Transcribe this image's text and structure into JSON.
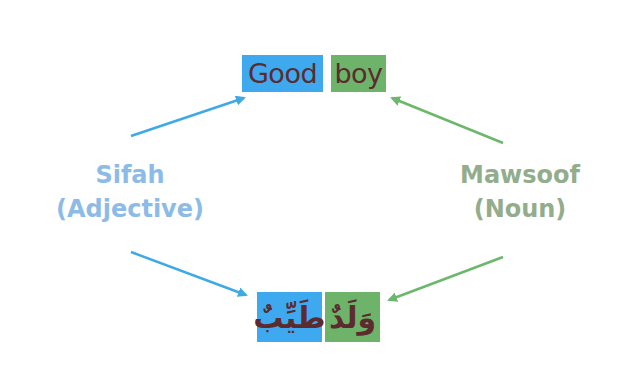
{
  "colors": {
    "sifah_box": "#3fa9f0",
    "mawsoof_box": "#6db36a",
    "word_text": "#5b2b2e",
    "sifah_label": "#8dbbe8",
    "mawsoof_label": "#93ad8c",
    "sifah_arrow": "#3fa9e5",
    "mawsoof_arrow": "#6cb86a"
  },
  "english": {
    "adjective_word": "Good",
    "noun_word": "boy"
  },
  "arabic": {
    "adjective_word": "طَيِّبٌ",
    "noun_word": "وَلَدٌ"
  },
  "labels": {
    "sifah": {
      "line1": "Sifah",
      "line2": "(Adjective)"
    },
    "mawsoof": {
      "line1": "Mawsoof",
      "line2": "(Noun)"
    }
  }
}
